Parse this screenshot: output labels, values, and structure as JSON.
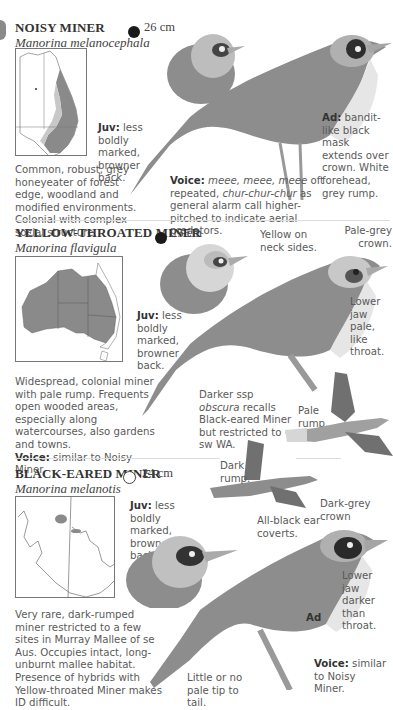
{
  "side_tab": {
    "color": "#8a8a8a"
  },
  "species": [
    {
      "common_name": "NOISY MINER",
      "scientific_name": "Manorina melanocephala",
      "size": "26 cm",
      "status_icon": "filled-circle",
      "juv_label": "Juv:",
      "juv_text": "less boldly marked, browner back.",
      "ad_label": "Ad:",
      "ad_text": "bandit-like black mask extends over crown. White forehead, grey rump.",
      "description": "Common, robust, grey honeyeater of forest edge, woodland and modified environments. Colonial with complex social structure.",
      "voice_label": "Voice:",
      "voice_italic_1": "meee, meee, meee",
      "voice_text_1": "oft repeated,",
      "voice_italic_2": "chur-chur-chur",
      "voice_text_2": "as general alarm call higher-pitched to indicate aerial predators."
    },
    {
      "common_name": "YELLOW-THROATED MINER",
      "scientific_name": "Manorina flavigula",
      "size": "25 cm",
      "status_icon": "filled-circle",
      "juv_label": "Juv:",
      "juv_text": "less boldly marked, browner back.",
      "annotations": {
        "neck": "Yellow on neck sides.",
        "crown": "Pale-grey crown.",
        "jaw": "Lower jaw pale, like throat.",
        "ssp_prefix": "Darker ssp",
        "ssp_italic": "obscura",
        "ssp_text": "recalls Black-eared Miner but restricted to sw WA.",
        "rump": "Pale rump."
      },
      "description": "Widespread, colonial miner with pale rump. Frequents open wooded areas, especially along watercourses, also gardens and towns.",
      "voice_label": "Voice:",
      "voice_text": "similar to Noisy Miner."
    },
    {
      "common_name": "BLACK-EARED MINER",
      "scientific_name": "Manorina melanotis",
      "size": "24 cm",
      "status_icon": "open-circle",
      "juv_label": "Juv:",
      "juv_text": "less boldly marked, browner back.",
      "annotations": {
        "rump": "Dark rump.",
        "crown": "Dark-grey crown",
        "ear": "All-black ear coverts.",
        "jaw": "Lower jaw darker than throat.",
        "ad": "Ad",
        "tail": "Little or no pale tip to tail."
      },
      "description": "Very rare, dark-rumped miner restricted to a few sites in Murray Mallee of se Aus. Occupies intact, long-unburnt mallee habitat. Presence of hybrids with Yellow-throated Miner makes ID difficult.",
      "voice_label": "Voice:",
      "voice_text": "similar to Noisy Miner."
    }
  ],
  "colors": {
    "range_dark": "#8a8a8a",
    "range_light": "#c8c8c8",
    "bird_grey": "#8d8d8d"
  }
}
